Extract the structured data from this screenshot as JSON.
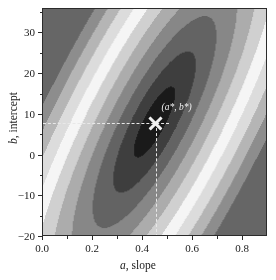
{
  "figure": {
    "background": "#ffffff",
    "frame_color": "#2b2b2b"
  },
  "chart_data": {
    "type": "heatmap",
    "title": "",
    "subtitle": "",
    "xlabel_parts": {
      "symbol": "a",
      "text": ", slope"
    },
    "ylabel_parts": {
      "symbol": "b",
      "text": ", intercept"
    },
    "xlabel": "a, slope",
    "ylabel": "b, intercept",
    "xlim": [
      0.0,
      0.9
    ],
    "ylim": [
      -20,
      36
    ],
    "xticks": [
      0.0,
      0.2,
      0.4,
      0.6,
      0.8
    ],
    "xticklabels": [
      "0.0",
      "0.2",
      "0.4",
      "0.6",
      "0.8"
    ],
    "x_minor_ticks": [
      0.1,
      0.3,
      0.5,
      0.7
    ],
    "yticks": [
      -20,
      -10,
      0,
      10,
      20,
      30
    ],
    "yticklabels": [
      "−20",
      "−10",
      "0",
      "10",
      "20",
      "30"
    ],
    "y_minor_ticks": [
      -15,
      -5,
      5,
      15,
      25,
      35
    ],
    "grid": false,
    "legend": "none",
    "colormap": "grayscale",
    "colormap_low": "#1c1c1c",
    "colormap_high": "#ffffff",
    "n_contour_bands": 11,
    "surface": {
      "description": "Elliptical quadratic cost surface, dark at minimum",
      "center_a": 0.45,
      "center_b": 8,
      "sigma_major": 0.62,
      "sigma_minor": 0.17,
      "rotation_deg": 62
    },
    "annotations": [
      {
        "name": "optimum",
        "label": "(a*, b*)",
        "x": 0.45,
        "y": 8,
        "marker": "x-cross",
        "marker_color": "#f2f2f2",
        "guides": "dashed-crosshair-to-axes",
        "guide_color": "#e8e8e8"
      }
    ]
  }
}
